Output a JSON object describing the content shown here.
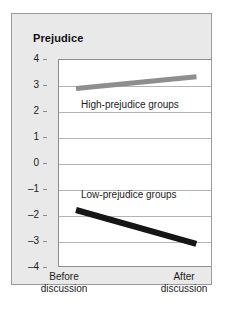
{
  "chart_data": {
    "type": "line",
    "title": "Prejudice",
    "xlabel": "",
    "ylabel": "Prejudice",
    "ylim": [
      -4,
      4
    ],
    "yticks": [
      "4",
      "3",
      "2",
      "1",
      "0",
      "–1",
      "–2",
      "–3",
      "–4"
    ],
    "ytick_values": [
      4,
      3,
      2,
      1,
      0,
      -1,
      -2,
      -3,
      -4
    ],
    "grid": true,
    "legend_position": "inline-annotation",
    "categories": [
      "Before discussion",
      "After discussion"
    ],
    "xticklabels": [
      {
        "line1": "Before",
        "line2": "discussion"
      },
      {
        "line1": "After",
        "line2": "discussion"
      }
    ],
    "series": [
      {
        "name": "High-prejudice groups",
        "values": [
          2.9,
          3.35
        ],
        "color": "#8e8e8e",
        "label": "High-prejudice groups"
      },
      {
        "name": "Low-prejudice groups",
        "values": [
          -1.75,
          -3.05
        ],
        "color": "#161616",
        "label": "Low-prejudice groups"
      }
    ],
    "annotations": [
      {
        "text": "High-prejudice groups"
      },
      {
        "text": "Low-prejudice groups"
      }
    ]
  },
  "card": {
    "background": "#e9e9e9",
    "border": "#9a9a9a"
  }
}
